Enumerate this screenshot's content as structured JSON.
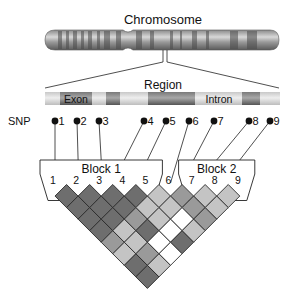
{
  "title": "Chromosome",
  "region_label": "Region",
  "snp_axis_label": "SNP",
  "segments": [
    {
      "label": "Exon",
      "x1": 60,
      "x2": 92
    },
    {
      "label": "",
      "x1": 106,
      "x2": 120
    },
    {
      "label": "",
      "x1": 148,
      "x2": 195
    },
    {
      "label": "",
      "x1": 242,
      "x2": 260
    }
  ],
  "intron_label": "Intron",
  "snps": [
    {
      "id": "1",
      "x": 55
    },
    {
      "id": "2",
      "x": 77
    },
    {
      "id": "3",
      "x": 99
    },
    {
      "id": "4",
      "x": 144
    },
    {
      "id": "5",
      "x": 166
    },
    {
      "id": "6",
      "x": 189
    },
    {
      "id": "7",
      "x": 214
    },
    {
      "id": "8",
      "x": 249
    },
    {
      "id": "9",
      "x": 270
    }
  ],
  "blocks": [
    {
      "label": "Block 1",
      "snps": [
        "1",
        "2",
        "3",
        "4",
        "5"
      ]
    },
    {
      "label": "Block 2",
      "snps": [
        "7",
        "8",
        "9"
      ]
    }
  ],
  "ld_matrix_labels": [
    "1",
    "2",
    "3",
    "4",
    "5",
    "6",
    "7",
    "8",
    "9"
  ],
  "ld_levels": {
    "dark": "#6e6e6e",
    "mid": "#9a9a9a",
    "light": "#c4c4c4",
    "white": "#ffffff"
  },
  "ld_cells": [
    [
      "dark",
      "dark",
      "dark",
      "dark",
      "light",
      "mid",
      "light",
      "light"
    ],
    [
      "dark",
      "dark",
      "dark",
      "light",
      "light",
      "mid",
      "light"
    ],
    [
      "dark",
      "dark",
      "mid",
      "light",
      "white",
      "mid"
    ],
    [
      "dark",
      "light",
      "dark",
      "white",
      "light"
    ],
    [
      "mid",
      "light",
      "white",
      "dark"
    ],
    [
      "light",
      "mid",
      "white"
    ],
    [
      "dark",
      "light"
    ],
    [
      "dark"
    ]
  ]
}
